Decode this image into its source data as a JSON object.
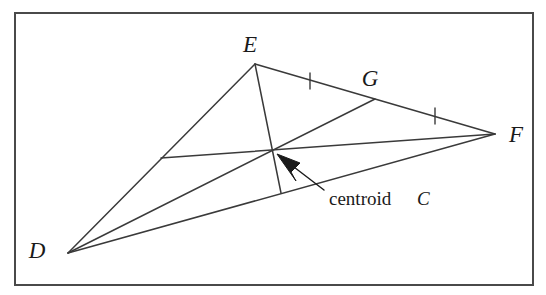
{
  "figure": {
    "kind": "geometry-diagram",
    "background_color": "#ffffff",
    "stroke_color": "#3a3a3a",
    "text_color": "#1a1a1a",
    "border": {
      "color": "#4a4a4a",
      "width": 2,
      "x": 15,
      "y": 13,
      "w": 518,
      "h": 272
    },
    "vertices": [
      {
        "id": "D",
        "label": "D",
        "x": 68,
        "y": 253,
        "label_x": 37,
        "label_y": 258
      },
      {
        "id": "E",
        "label": "E",
        "x": 255,
        "y": 64,
        "label_x": 244,
        "label_y": 52
      },
      {
        "id": "F",
        "label": "F",
        "x": 495,
        "y": 134,
        "label_x": 510,
        "label_y": 142
      }
    ],
    "midpoints": [
      {
        "id": "G",
        "label": "G",
        "of": "EF",
        "x": 375,
        "y": 99,
        "label_x": 362,
        "label_y": 86
      },
      {
        "id": "M_DE",
        "label": "",
        "of": "DE",
        "x": 161,
        "y": 158,
        "label_x": 0,
        "label_y": 0
      },
      {
        "id": "M_DF",
        "label": "",
        "of": "DF",
        "x": 281,
        "y": 193,
        "label_x": 0,
        "label_y": 0
      }
    ],
    "centroid": {
      "id": "C",
      "x": 273,
      "y": 150
    },
    "sides": [
      {
        "id": "DE",
        "from": "D",
        "to": "E"
      },
      {
        "id": "EF",
        "from": "E",
        "to": "F"
      },
      {
        "id": "DF",
        "from": "D",
        "to": "F"
      }
    ],
    "medians": [
      {
        "id": "median-E-to-DF",
        "from": "E",
        "to": "M_DF"
      },
      {
        "id": "median-F-to-DE",
        "from": "F",
        "to": "M_DE"
      },
      {
        "id": "median-D-to-G",
        "from": "D",
        "to": "G"
      }
    ],
    "tick_marks": [
      {
        "id": "tick-EG",
        "on": "EG",
        "x": 310,
        "y": 81
      },
      {
        "id": "tick-GF",
        "on": "GF",
        "x": 435,
        "y": 116
      }
    ],
    "annotation": {
      "text": "centroid",
      "italic_symbol": "C",
      "text_x": 329,
      "text_y": 205,
      "symbol_x": 415,
      "symbol_y": 205,
      "arrow": {
        "tail_x": 324,
        "tail_y": 190,
        "tip_x": 277,
        "tip_y": 154
      }
    }
  }
}
